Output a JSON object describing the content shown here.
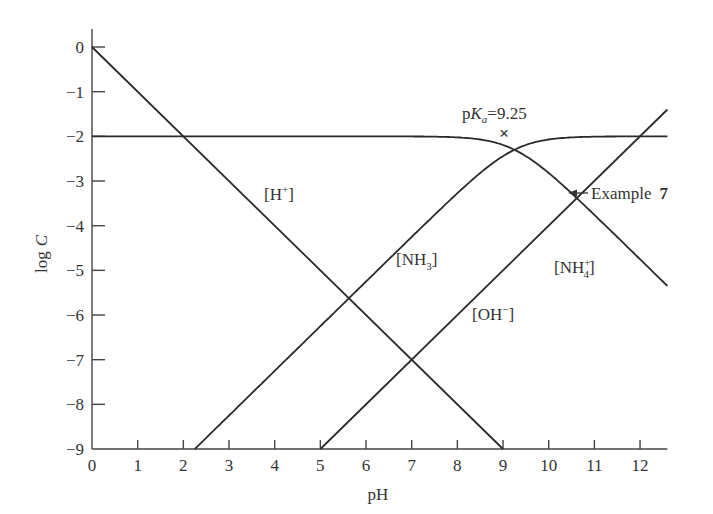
{
  "chart_data": {
    "type": "line",
    "title": "",
    "xlabel": "pH",
    "ylabel": "log C",
    "xlim": [
      0,
      12.6
    ],
    "ylim": [
      -9,
      0
    ],
    "xticks": [
      "0",
      "1",
      "2",
      "3",
      "4",
      "5",
      "6",
      "7",
      "8",
      "9",
      "10",
      "11",
      "12"
    ],
    "yticks": [
      "0",
      "−1",
      "−2",
      "−3",
      "−4",
      "−5",
      "−6",
      "−7",
      "−8",
      "−9"
    ],
    "grid": false,
    "legend": "none (inline labels)",
    "constants": {
      "C_total_log": -2,
      "pKa": 9.25,
      "pKw": 14
    },
    "series": [
      {
        "name": "[H+]",
        "label": "[H⁺]",
        "x": [
          0,
          9
        ],
        "values": [
          0,
          -9
        ]
      },
      {
        "name": "[OH-]",
        "label": "[OH⁻]",
        "x": [
          5,
          12.6
        ],
        "values": [
          -9,
          -1.4
        ]
      },
      {
        "name": "[NH3]",
        "label": "[NH₃]",
        "x": [
          2.25,
          4,
          6,
          7.25,
          8,
          9.25,
          10,
          11,
          12.6
        ],
        "values": [
          -9,
          -7.25,
          -5.25,
          -4.0,
          -3.27,
          -2.3,
          -2.07,
          -2.01,
          -2.0
        ]
      },
      {
        "name": "[NH4+]",
        "label": "[NH₄⁺]",
        "x": [
          0,
          7,
          7.5,
          8,
          9.25,
          10,
          10.6,
          11,
          12,
          12.6
        ],
        "values": [
          -2,
          -2.0,
          -2.01,
          -2.03,
          -2.3,
          -2.82,
          -3.37,
          -3.76,
          -4.75,
          -5.35
        ]
      }
    ],
    "annotations": [
      {
        "text": "pK_a = 9.25",
        "marker": "×",
        "x": 9.25,
        "y": -1.9
      },
      {
        "text": "Example 7",
        "arrow_to": {
          "x": 10.6,
          "y": -3.3
        }
      }
    ]
  },
  "labels": {
    "xlabel": "pH",
    "ylabel_log": "log",
    "ylabel_c": "C",
    "h_plus": "[H",
    "h_plus_sup": "+",
    "oh_minus": "[OH",
    "oh_minus_sup": "−",
    "nh3": "[NH",
    "nh3_sub": "3",
    "nh4": "[NH",
    "nh4_sub": "4",
    "nh4_sup": "+",
    "close_bracket": "]",
    "pka_p": "p",
    "pka_k": "K",
    "pka_a": "a",
    "pka_value": "=9.25",
    "pka_marker": "×",
    "example": "Example",
    "example_num": "7"
  }
}
